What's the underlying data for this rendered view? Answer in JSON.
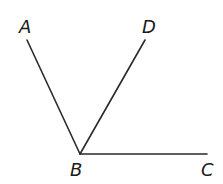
{
  "diagram": {
    "type": "angle-figure",
    "vertex": "B",
    "points": [
      {
        "id": "A",
        "label": "A",
        "x": 27,
        "y": 40,
        "label_x": 19,
        "label_y": 33
      },
      {
        "id": "D",
        "label": "D",
        "x": 145,
        "y": 40,
        "label_x": 142,
        "label_y": 33
      },
      {
        "id": "B",
        "label": "B",
        "x": 80,
        "y": 154,
        "label_x": 70,
        "label_y": 176
      },
      {
        "id": "C",
        "label": "C",
        "x": 207,
        "y": 154,
        "label_x": 201,
        "label_y": 176
      }
    ],
    "rays": [
      {
        "name": "BA",
        "from": "B",
        "to": "A"
      },
      {
        "name": "BD",
        "from": "B",
        "to": "D"
      },
      {
        "name": "BC",
        "from": "B",
        "to": "C"
      }
    ],
    "colors": {
      "stroke": "#2a2a2a",
      "text": "#1a1a1a",
      "background": "#ffffff"
    }
  }
}
